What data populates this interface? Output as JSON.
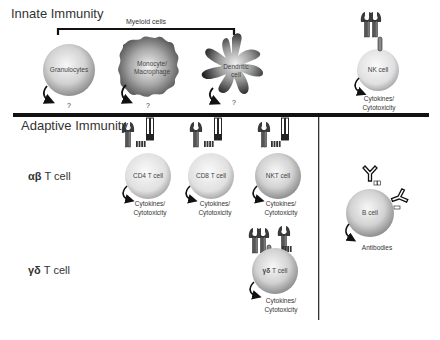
{
  "sections": {
    "innate": {
      "title": "Innate Immunity"
    },
    "adaptive": {
      "title": "Adaptive Immunity"
    }
  },
  "bracket": {
    "label": "Myeloid cells"
  },
  "rows": {
    "ab": {
      "symbol": "αβ",
      "label": " T cell"
    },
    "gd": {
      "symbol": "γδ",
      "label": " T cell"
    }
  },
  "cells": {
    "granulocytes": {
      "label": "Granulocytes",
      "output": "?"
    },
    "monocyte": {
      "label_line1": "Monocyte/",
      "label_line2": "Macrophage",
      "output": "?"
    },
    "dendritic": {
      "label_line1": "Dendritic",
      "label_line2": "cell",
      "output": "?"
    },
    "nk": {
      "label": "NK cell",
      "output_line1": "Cytokines/",
      "output_line2": "Cytotoxicity"
    },
    "cd4": {
      "label": "CD4 T cell",
      "output_line1": "Cytokines/",
      "output_line2": "Cytotoxicity"
    },
    "cd8": {
      "label": "CD8 T cell",
      "output_line1": "Cytokines/",
      "output_line2": "Cytotoxicity"
    },
    "nkt": {
      "label": "NKT cell",
      "output_line1": "Cytokines/",
      "output_line2": "Cytotoxicity"
    },
    "gd": {
      "symbol": "γδ",
      "label": " T cell",
      "output_line1": "Cytokines/",
      "output_line2": "Cytotoxicity"
    },
    "b": {
      "label": "B cell",
      "output": "Antibodies"
    }
  },
  "colors": {
    "divider": "#111111",
    "cell_light": "#f2f2f2",
    "cell_dark": "#9a9a9a",
    "receptor": "#2a2a2a"
  }
}
